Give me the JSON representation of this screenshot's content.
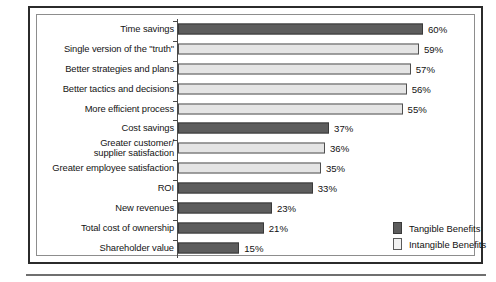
{
  "chart_data": {
    "type": "bar",
    "orientation": "horizontal",
    "title": "",
    "xlabel": "",
    "ylabel": "",
    "xlim": [
      0,
      60
    ],
    "grid": false,
    "legend_position": "right-bottom-inside",
    "value_suffix": "%",
    "categories": [
      "Time savings",
      "Single version of the \"truth\"",
      "Better strategies and plans",
      "Better tactics and decisions",
      "More efficient process",
      "Cost savings",
      "Greater customer/\nsupplier satisfaction",
      "Greater employee satisfaction",
      "ROI",
      "New revenues",
      "Total cost of ownership",
      "Shareholder value"
    ],
    "values": [
      60,
      59,
      57,
      56,
      55,
      37,
      36,
      35,
      33,
      23,
      21,
      15
    ],
    "value_labels": [
      "60%",
      "59%",
      "57%",
      "56%",
      "55%",
      "37%",
      "36%",
      "35%",
      "33%",
      "23%",
      "21%",
      "15%"
    ],
    "series_of_bar": [
      "tangible",
      "intangible",
      "intangible",
      "intangible",
      "intangible",
      "tangible",
      "intangible",
      "intangible",
      "tangible",
      "tangible",
      "tangible",
      "tangible"
    ],
    "series": [
      {
        "name": "Tangible Benefits",
        "color": "#5d5d5d"
      },
      {
        "name": "Intangible Benefits",
        "color": "#e4e4e4"
      }
    ]
  },
  "legend": {
    "items": [
      {
        "label": "Tangible Benefits",
        "key": "tangible"
      },
      {
        "label": "Intangible Benefits",
        "key": "intangible"
      }
    ]
  }
}
